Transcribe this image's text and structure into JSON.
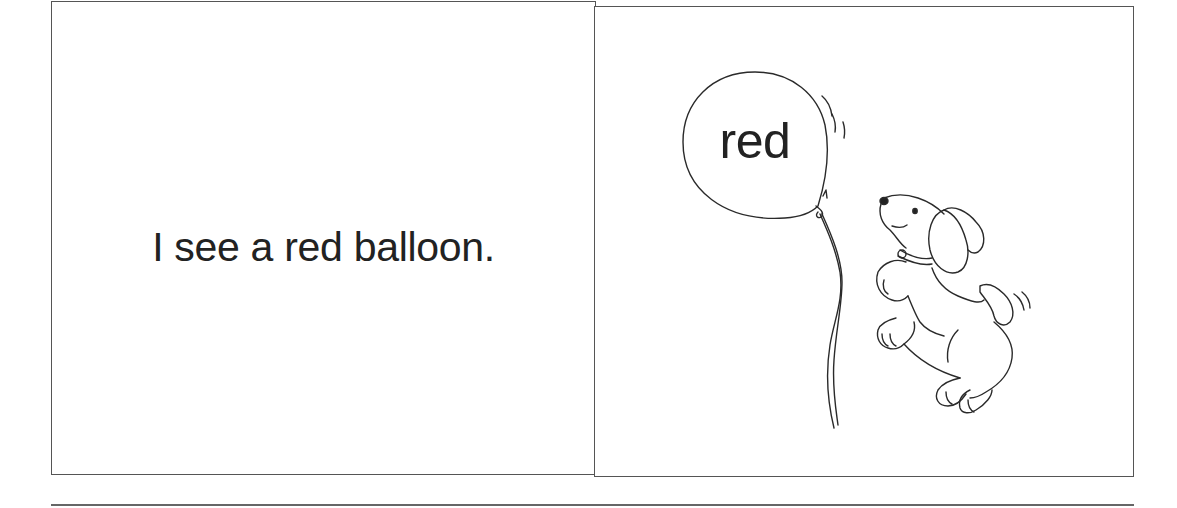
{
  "page": {
    "left_panel": {
      "sentence": "I see a red balloon."
    },
    "right_panel": {
      "illustration": {
        "balloon_label": "red",
        "subject": "puppy holding a balloon string",
        "icon": "balloon-puppy-illustration"
      }
    }
  },
  "colors": {
    "background": "#ffffff",
    "ink": "#222222",
    "border": "#555555"
  }
}
